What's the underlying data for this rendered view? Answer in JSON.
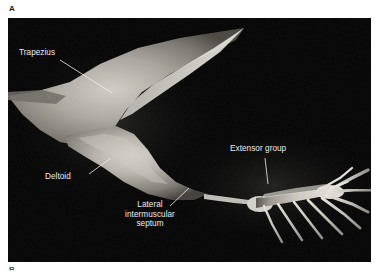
{
  "figure": {
    "panel_letter": "A",
    "next_panel_letter": "B",
    "background_color": "#ffffff",
    "plate_color": "#030303",
    "label_color": "#ececec",
    "leader_color": "#e8e8e8"
  },
  "annotations": {
    "trapezius": {
      "label": "Trapezius"
    },
    "deltoid": {
      "label": "Deltoid"
    },
    "septum": {
      "line1": "Lateral",
      "line2": "intermuscular",
      "line3": "septum"
    },
    "extensor_group": {
      "label": "Extensor group"
    }
  }
}
